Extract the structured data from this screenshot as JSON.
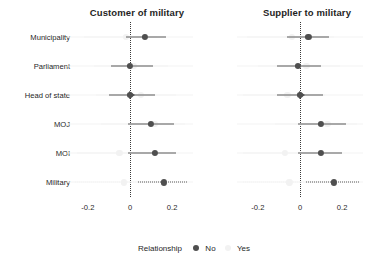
{
  "chart_data": {
    "type": "scatter",
    "title": "",
    "xlabel": "",
    "ylabel": "",
    "xlim": [
      -0.28,
      0.28
    ],
    "xticks": [
      -0.2,
      0,
      0.2
    ],
    "xtick_labels": [
      "-0.2",
      "0",
      "0.2"
    ],
    "categories": [
      "Municipality",
      "Parliament",
      "Head of state",
      "MOJ",
      "MOI",
      "Military"
    ],
    "grid": false,
    "legend_position": "bottom",
    "reference_line": 0,
    "panels": [
      {
        "title": "Customer of military",
        "series": [
          {
            "name": "No",
            "color": "#4f4f4f",
            "points": [
              {
                "category": "Municipality",
                "estimate": 0.07,
                "low": -0.02,
                "high": 0.17,
                "line_style": "solid",
                "clipped": false
              },
              {
                "category": "Parliament",
                "estimate": 0.0,
                "low": -0.09,
                "high": 0.11,
                "line_style": "solid",
                "clipped": false
              },
              {
                "category": "Head of state",
                "estimate": 0.0,
                "low": -0.1,
                "high": 0.12,
                "line_style": "solid",
                "clipped": true
              },
              {
                "category": "MOJ",
                "estimate": 0.1,
                "low": -0.01,
                "high": 0.21,
                "line_style": "solid",
                "clipped": false
              },
              {
                "category": "MOI",
                "estimate": 0.12,
                "low": -0.01,
                "high": 0.22,
                "line_style": "solid",
                "clipped": false
              },
              {
                "category": "Military",
                "estimate": 0.16,
                "low": 0.04,
                "high": 0.27,
                "line_style": "dotted",
                "clipped": false
              }
            ]
          },
          {
            "name": "Yes",
            "color": "#f2f2f2",
            "points": [
              {
                "category": "Municipality",
                "estimate": -0.02,
                "low": -0.22,
                "high": 0.13,
                "line_style": "solid",
                "clipped": false
              },
              {
                "category": "Parliament",
                "estimate": 0.02,
                "low": -0.17,
                "high": 0.18,
                "line_style": "solid",
                "clipped": false
              },
              {
                "category": "Head of state",
                "estimate": 0.05,
                "low": -0.16,
                "high": 0.22,
                "line_style": "solid",
                "clipped": false
              },
              {
                "category": "MOJ",
                "estimate": 0.12,
                "low": -0.14,
                "high": 0.26,
                "line_style": "solid",
                "clipped": false
              },
              {
                "category": "MOI",
                "estimate": -0.05,
                "low": -0.25,
                "high": 0.14,
                "line_style": "solid",
                "clipped": false
              },
              {
                "category": "Military",
                "estimate": -0.03,
                "low": -0.26,
                "high": 0.17,
                "line_style": "dotted",
                "clipped": false
              }
            ]
          }
        ]
      },
      {
        "title": "Supplier to military",
        "series": [
          {
            "name": "No",
            "color": "#4f4f4f",
            "points": [
              {
                "category": "Municipality",
                "estimate": 0.04,
                "low": -0.06,
                "high": 0.14,
                "line_style": "solid",
                "clipped": false
              },
              {
                "category": "Parliament",
                "estimate": -0.01,
                "low": -0.11,
                "high": 0.1,
                "line_style": "solid",
                "clipped": false
              },
              {
                "category": "Head of state",
                "estimate": 0.0,
                "low": -0.11,
                "high": 0.11,
                "line_style": "solid",
                "clipped": true
              },
              {
                "category": "MOJ",
                "estimate": 0.1,
                "low": -0.01,
                "high": 0.22,
                "line_style": "solid",
                "clipped": false
              },
              {
                "category": "MOI",
                "estimate": 0.1,
                "low": -0.01,
                "high": 0.2,
                "line_style": "solid",
                "clipped": false
              },
              {
                "category": "Military",
                "estimate": 0.16,
                "low": 0.03,
                "high": 0.28,
                "line_style": "dotted",
                "clipped": false
              }
            ]
          },
          {
            "name": "Yes",
            "color": "#f2f2f2",
            "points": [
              {
                "category": "Municipality",
                "estimate": -0.04,
                "low": -0.25,
                "high": 0.16,
                "line_style": "solid",
                "clipped": false
              },
              {
                "category": "Parliament",
                "estimate": 0.03,
                "low": -0.2,
                "high": 0.19,
                "line_style": "solid",
                "clipped": false
              },
              {
                "category": "Head of state",
                "estimate": -0.06,
                "low": -0.27,
                "high": 0.12,
                "line_style": "solid",
                "clipped": false
              },
              {
                "category": "MOJ",
                "estimate": 0.13,
                "low": -0.12,
                "high": 0.27,
                "line_style": "solid",
                "clipped": false
              },
              {
                "category": "MOI",
                "estimate": -0.07,
                "low": -0.27,
                "high": 0.13,
                "line_style": "solid",
                "clipped": false
              },
              {
                "category": "Military",
                "estimate": -0.05,
                "low": -0.27,
                "high": 0.16,
                "line_style": "dotted",
                "clipped": false
              }
            ]
          }
        ]
      }
    ],
    "legend": {
      "title": "Relationship",
      "entries": [
        {
          "label": "No",
          "color": "#4f4f4f"
        },
        {
          "label": "Yes",
          "color": "#f2f2f2"
        }
      ]
    }
  }
}
